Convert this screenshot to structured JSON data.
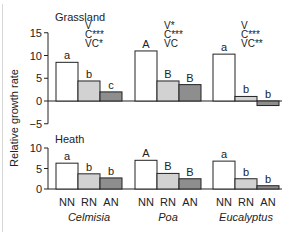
{
  "chart_data": {
    "type": "bar",
    "ylabel": "Relative growth rate",
    "categories": [
      "NN",
      "RN",
      "AN"
    ],
    "groups": [
      "Celmisia",
      "Poa",
      "Eucalyptus"
    ],
    "colors": {
      "NN": "#ffffff",
      "RN": "#d2d2d2",
      "AN": "#8e8e8e",
      "stroke": "#222222"
    },
    "panels": [
      {
        "title": "Grassland",
        "ylim": [
          -5,
          15
        ],
        "yticks": [
          -5,
          0,
          5,
          10,
          15
        ],
        "series": [
          {
            "group": "Celmisia",
            "values": [
              8.5,
              4.4,
              2.0
            ],
            "letters": [
              "a",
              "b",
              "c"
            ],
            "stats": [
              "V",
              "C***",
              "VC*"
            ]
          },
          {
            "group": "Poa",
            "values": [
              11.0,
              4.4,
              3.6
            ],
            "letters": [
              "A",
              "B",
              "B"
            ],
            "stats": [
              "V*",
              "C***",
              "VC"
            ]
          },
          {
            "group": "Eucalyptus",
            "values": [
              10.3,
              1.0,
              -1.0
            ],
            "letters": [
              "a",
              "b",
              "b"
            ],
            "stats": [
              "V",
              "C***",
              "VC**"
            ]
          }
        ]
      },
      {
        "title": "Heath",
        "ylim": [
          0,
          10
        ],
        "yticks": [
          0,
          5,
          10
        ],
        "series": [
          {
            "group": "Celmisia",
            "values": [
              6.3,
              3.7,
              2.7
            ],
            "letters": [
              "a",
              "b",
              "b"
            ]
          },
          {
            "group": "Poa",
            "values": [
              7.0,
              3.8,
              2.5
            ],
            "letters": [
              "A",
              "B",
              "B"
            ]
          },
          {
            "group": "Eucalyptus",
            "values": [
              6.8,
              2.5,
              0.8
            ],
            "letters": [
              "a",
              "b",
              "b"
            ]
          }
        ]
      }
    ]
  }
}
